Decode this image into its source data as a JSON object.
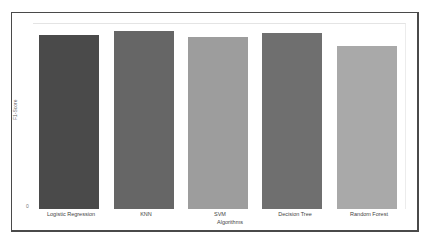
{
  "chart_data": {
    "type": "bar",
    "title": "",
    "xlabel": "Algorithms",
    "ylabel": "F1-Score",
    "categories": [
      "Logistic Regression",
      "KNN",
      "SVM",
      "Decision Tree",
      "Random Forest"
    ],
    "values": [
      0.94,
      0.96,
      0.93,
      0.95,
      0.88
    ],
    "colors": [
      "#4a4a4a",
      "#666666",
      "#9d9d9d",
      "#6f6f6f",
      "#a9a9a9"
    ],
    "yticks": [
      "0"
    ],
    "ylim": [
      0,
      1.0
    ],
    "grid": false,
    "legend": null
  }
}
